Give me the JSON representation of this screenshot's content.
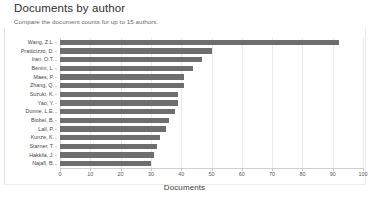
{
  "header": {
    "title": "Documents by author",
    "subtitle": "Compare the document counts for up to 15 authors."
  },
  "colors": {
    "bar": "#6e6e6e",
    "gridline": "#eaeaea",
    "axis": "#d0d0d0",
    "title_text": "#2f2f2f",
    "subtitle_text": "#6a6a6a",
    "label_text": "#4a4a4a"
  },
  "chart_data": {
    "type": "bar",
    "orientation": "horizontal",
    "title": "Documents by author",
    "subtitle": "Compare the document counts for up to 15 authors.",
    "xlabel": "Documents",
    "ylabel": "",
    "xlim": [
      0,
      100
    ],
    "xticks": [
      0,
      10,
      20,
      30,
      40,
      50,
      60,
      70,
      80,
      90,
      100
    ],
    "grid": true,
    "grid_axis": "x",
    "legend": false,
    "categories": [
      "Wang, Z.L.",
      "Pratticizzo, D.",
      "Iran, O.T.",
      "Benini, L.",
      "Maes, P.",
      "Zhang, Q.",
      "Suzuki, K.",
      "Yao, Y.",
      "Dunne, L.E.",
      "Biobel, B.",
      "Lall, P.",
      "Kunze, K.",
      "Starner, T.",
      "Hakkila, J.",
      "Najafi, B."
    ],
    "values": [
      92,
      50,
      47,
      44,
      41,
      41,
      39,
      39,
      38,
      36,
      35,
      33,
      32,
      31,
      30
    ]
  }
}
